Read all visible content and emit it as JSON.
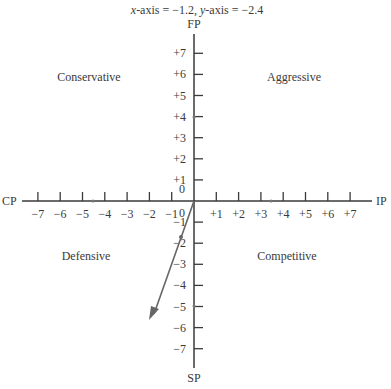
{
  "chart_data": {
    "type": "scatter",
    "title": "x-axis = −1.2, y-axis = −2.4",
    "title_parts": {
      "x_label": "x",
      "x_rest": "-axis = −1.2, ",
      "y_label": "y",
      "y_rest": "-axis = −2.4"
    },
    "axes": {
      "top_label": "FP",
      "bottom_label": "SP",
      "left_label": "CP",
      "right_label": "IP",
      "xlim": [
        -7,
        7
      ],
      "ylim": [
        -7,
        7
      ],
      "x_ticks": [
        "−7",
        "−6",
        "−5",
        "−4",
        "−3",
        "−2",
        "−1",
        "0",
        "+1",
        "+2",
        "+3",
        "+4",
        "+5",
        "+6",
        "+7"
      ],
      "y_ticks": [
        "+7",
        "+6",
        "+5",
        "+4",
        "+3",
        "+2",
        "+1",
        "0",
        "−1",
        "−2",
        "−3",
        "−4",
        "−5",
        "−6",
        "−7"
      ],
      "x_origin_label": "0",
      "y_origin_label": "0"
    },
    "quadrants": [
      {
        "name": "Conservative",
        "position": "top-left"
      },
      {
        "name": "Aggressive",
        "position": "top-right"
      },
      {
        "name": "Defensive",
        "position": "bottom-left"
      },
      {
        "name": "Competitive",
        "position": "bottom-right"
      }
    ],
    "vector": {
      "from": [
        0,
        0
      ],
      "point": [
        -1.2,
        -2.4
      ],
      "arrow_to": [
        -2.0,
        -5.0
      ]
    },
    "axis_markers": [
      {
        "x": -4.5,
        "y": 0
      },
      {
        "x": 3,
        "y": 0
      },
      {
        "x": 0,
        "y": 2
      },
      {
        "x": 0,
        "y": -4.5
      }
    ],
    "grid": false,
    "legend": null
  }
}
